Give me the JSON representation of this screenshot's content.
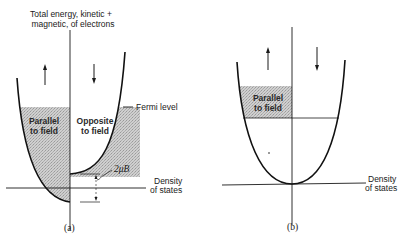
{
  "diagram": {
    "panel_a": {
      "caption": "(a)",
      "yaxis_label_line1": "Total energy, kinetic +",
      "yaxis_label_line2": "magnetic, of electrons",
      "xaxis_label_line1": "Density",
      "xaxis_label_line2": "of states",
      "fermi_label": "Fermi level",
      "left_band_line1": "Parallel",
      "left_band_line2": "to field",
      "right_band_line1": "Opposite",
      "right_band_line2": "to field",
      "splitting_label": "2μB",
      "left_arrow": "up-arrow",
      "right_arrow": "down-arrow"
    },
    "panel_b": {
      "caption": "(b)",
      "xaxis_label_line1": "Density",
      "xaxis_label_line2": "of states",
      "band_line1": "Parallel",
      "band_line2": "to field",
      "left_arrow": "up-arrow",
      "right_arrow": "down-arrow"
    },
    "colors": {
      "ink": "#1a1a1a",
      "shade": "#c4c4c4"
    }
  }
}
